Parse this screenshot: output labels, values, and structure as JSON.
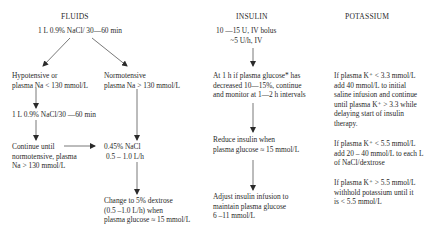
{
  "fluids": {
    "header": "FLUIDS",
    "start": "1 L 0.9% NaCl/ 30—60 min",
    "hypotensive": [
      "Hypotensive or",
      "plasma Na < 130 mmol/L"
    ],
    "repeat_saline": "1 L 0.9% NaCl/30 —60 min",
    "continue_until": [
      "Continue until",
      "normotensive, plasma",
      "Na > 130 mmol/L"
    ],
    "normotensive": [
      "Normotensive",
      "plasma Na > 130 mmol/L"
    ],
    "half_saline": [
      "0.45% NaCl",
      "0.5 – 1.0 L/h"
    ],
    "dextrose": [
      "Change to 5% dextrose",
      "(0.5 –1.0 L/h)  when",
      "plasma glucose ≈ 15 mmol/L"
    ]
  },
  "insulin": {
    "header": "INSULIN",
    "bolus": [
      "10 —15  U, IV bolus",
      "~5 U/h, IV"
    ],
    "check": [
      "At 1 h if plasma glucose* has",
      "decreased 10—15%, continue",
      "and monitor at 1—2 h intervals"
    ],
    "reduce": [
      "Reduce insulin when",
      "plasma glucose ≈ 15 mmol/L"
    ],
    "adjust": [
      "Adjust insulin infusion to",
      "maintain plasma glucose",
      "6 –11 mmol/L"
    ]
  },
  "potassium": {
    "header": "POTASSIUM",
    "low": [
      "If plasma K⁺ < 3.3 mmol/L",
      "add 40 mmol/L to initial",
      "saline infusion and continue",
      "until plasma K⁺ > 3.3 while",
      "delaying start of insulin",
      "therapy."
    ],
    "mid": [
      "If plasma K⁺ < 5.5 mmol/L",
      "add 20 – 40 mmol/L to each L",
      "of NaCl/dextrose"
    ],
    "high": [
      "If plasma K⁺ > 5.5 mmol/L",
      "withhold potassium until it",
      "is < 5.5 mmol/L"
    ]
  }
}
